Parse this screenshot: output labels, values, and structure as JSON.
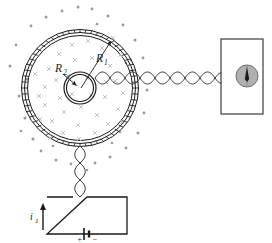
{
  "figure": {
    "background": "#ffffff",
    "width": 272,
    "height": 243
  },
  "labels": {
    "outer_radius": "R",
    "outer_radius_sub": "1",
    "inner_radius": "R",
    "inner_radius_sub": "2",
    "current": "i",
    "current_sub": "1",
    "battery_positive": "+",
    "battery_negative": "−"
  },
  "colors": {
    "stroke": "#1a1a1a",
    "field_cross": "#b9b9b9",
    "field_dot": "#9a9a9a",
    "meter_fill": "#b0b0b0",
    "meter_stroke": "#6e6e6e",
    "wire": "#2b2b2b",
    "box_stroke": "#4a4a4a"
  },
  "components": {
    "toroid": {
      "name": "toroidal-coil",
      "center_x": 80,
      "center_y": 88,
      "outer_radius": 58,
      "inner_radius": 16,
      "winding_rings": 3,
      "tick_count": 60,
      "note": "concentric triple ring with radial winding ticks"
    },
    "field_region": {
      "inside_symbol": "cross",
      "outside_symbol": "dot",
      "inside_meaning": "field into page",
      "outside_meaning": "field out of page"
    },
    "galvanometer": {
      "name": "galvanometer",
      "box_x": 221,
      "box_y": 39,
      "box_w": 42,
      "box_h": 75,
      "dial_cx": 247,
      "dial_cy": 76,
      "dial_r": 11,
      "needle": "vertical"
    },
    "battery_box": {
      "name": "battery-circuit",
      "box_x": 47,
      "box_y": 197,
      "box_w": 80,
      "box_h": 37,
      "cell_x": 88,
      "cell_y": 234
    },
    "wires": {
      "horizontal_twisted": {
        "x1": 96,
        "x2": 221,
        "y": 78,
        "twists": 13
      },
      "vertical_twisted": {
        "x": 80,
        "y1": 146,
        "y2": 197,
        "twists": 6
      }
    }
  },
  "arrows": {
    "radius_outer": {
      "from_x": 81,
      "from_y": 89,
      "to_x": 112,
      "to_y": 40
    },
    "radius_inner": {
      "from_x": 62,
      "from_y": 73,
      "to_x": 77,
      "to_y": 85
    },
    "current_direction": "up"
  }
}
